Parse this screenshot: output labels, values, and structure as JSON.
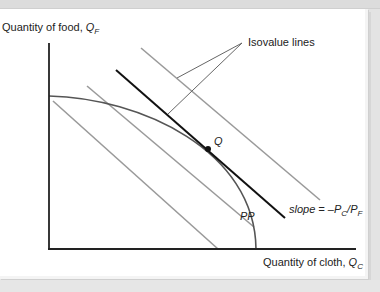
{
  "diagram": {
    "y_axis_label": {
      "text": "Quantity of food, ",
      "var": "Q",
      "sub": "F"
    },
    "x_axis_label": {
      "text": "Quantity of cloth, ",
      "var": "Q",
      "sub": "C"
    },
    "annotation_isovalue": "Isovalue lines",
    "point_label": "Q",
    "curve_label": "PP",
    "slope_label": {
      "prefix": "slope = –",
      "p1": "P",
      "s1": "C",
      "slash": "/",
      "p2": "P",
      "s2": "F"
    },
    "colors": {
      "axis": "#222222",
      "isovalue_gray": "#9a9a9a",
      "tangent_line": "#111111",
      "ppf_curve": "#555555",
      "background": "#ffffff"
    }
  }
}
